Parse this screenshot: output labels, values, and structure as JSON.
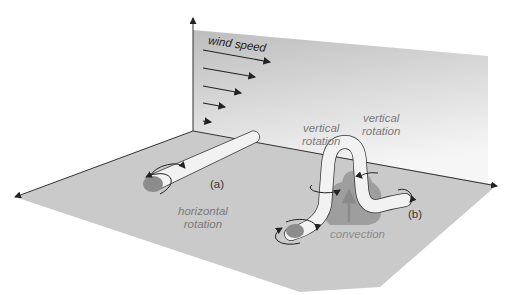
{
  "diagram": {
    "wall_label": "wind speed",
    "labels": {
      "horizontal_rotation": [
        "horizontal",
        "rotation"
      ],
      "vertical_rotation_left": [
        "vertical",
        "rotation"
      ],
      "vertical_rotation_right": [
        "vertical",
        "rotation"
      ],
      "convection": "convection"
    },
    "panel_tags": {
      "a": "(a)",
      "b": "(b)"
    },
    "wind_arrows": [
      {
        "length": 68
      },
      {
        "length": 52
      },
      {
        "length": 40
      },
      {
        "length": 26
      },
      {
        "length": 10
      }
    ],
    "colors": {
      "floor": "#c9c9c9",
      "wall_top": "#bdbdbd",
      "wall_bottom": "#f4f4f4",
      "tube": "#f2f2f2",
      "tube_end": "#8c8c8c",
      "cloud": "#9e9e9e",
      "convection_arrow": "#8a8a8a",
      "axis": "#333333"
    }
  }
}
